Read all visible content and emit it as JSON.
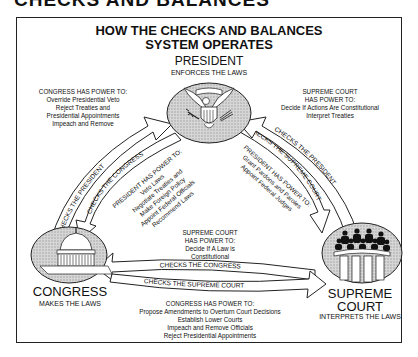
{
  "page_heading_cut": "CHECKS AND BALANCES",
  "title": {
    "line1": "HOW THE CHECKS AND BALANCES",
    "line2": "SYSTEM OPERATES"
  },
  "branches": {
    "president": {
      "name": "PRESIDENT",
      "role": "ENFORCES THE LAWS",
      "icon": "presidential-seal-icon"
    },
    "congress": {
      "name": "CONGRESS",
      "role": "MAKES THE LAWS",
      "icon": "capitol-building-icon"
    },
    "court": {
      "name_line1": "SUPREME",
      "name_line2": "COURT",
      "role": "INTERPRETS THE LAWS",
      "icon": "supreme-court-justices-icon"
    }
  },
  "powers": {
    "congress_over_president": {
      "heading": "CONGRESS HAS POWER TO:",
      "items": [
        "Override Presidential Veto",
        "Reject Treaties and",
        "Presidential Appointments",
        "Impeach and Remove"
      ]
    },
    "court_over_president": {
      "heading1": "SUPREME COURT",
      "heading2": "HAS POWER TO:",
      "items": [
        "Decide If Actions Are Constitutional",
        "Interpret Treaties"
      ]
    },
    "president_over_congress": {
      "heading": "PRESIDENT HAS POWER TO:",
      "items": [
        "Veto Laws",
        "Negotiate Treaties and",
        "Make Foreign Policy",
        "Appoint Federal Officials",
        "Recommend Laws"
      ]
    },
    "president_over_court": {
      "heading": "PRESIDENT HAS POWER TO:",
      "items": [
        "Grant Pardons and Paroles",
        "Appoint Federal Judges"
      ]
    },
    "court_over_congress": {
      "heading1": "SUPREME COURT",
      "heading2": "HAS POWER TO:",
      "items": [
        "Decide If A Law is",
        "Constitutional"
      ]
    },
    "congress_over_court": {
      "heading": "CONGRESS HAS POWER TO:",
      "items": [
        "Propose Amendments to Overturn Court Decisions",
        "Establish Lower Courts",
        "Impeach and Remove Officials",
        "Reject Presidential Appointments"
      ]
    }
  },
  "arrows": {
    "congress_checks_president": "CHECKS THE PRESIDENT",
    "president_checks_congress": "CHECKS THE CONGRESS",
    "court_checks_president": "CHECKS THE PRESIDENT",
    "president_checks_court": "CHECKS THE SUPREME COURT",
    "court_checks_congress": "CHECKS THE CONGRESS",
    "congress_checks_court": "CHECKS THE SUPREME COURT"
  },
  "colors": {
    "ink": "#111111",
    "oval_fill": "#c8c8c8",
    "background": "#ffffff"
  }
}
